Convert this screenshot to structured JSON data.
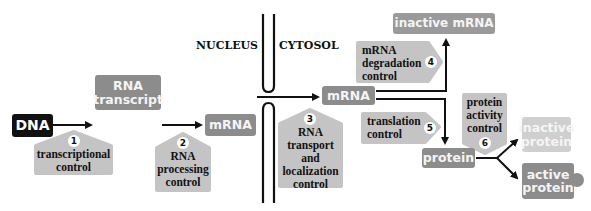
{
  "caption_fragment": "",
  "regions": {
    "nucleus": "NUCLEUS",
    "cytosol": "CYTOSOL"
  },
  "nodes": {
    "dna": "DNA",
    "rna_transcript_1": "RNA",
    "rna_transcript_2": "transcript",
    "mrna_nucleus": "mRNA",
    "mrna_cytosol": "mRNA",
    "inactive_mrna": "inactive mRNA",
    "protein": "protein",
    "inactive_protein_1": "inactive",
    "inactive_protein_2": "protein",
    "active_protein_1": "active",
    "active_protein_2": "protein"
  },
  "controls": [
    {
      "number": "1",
      "lines": [
        "transcriptional",
        "control"
      ]
    },
    {
      "number": "2",
      "lines": [
        "RNA",
        "processing",
        "control"
      ]
    },
    {
      "number": "3",
      "lines": [
        "RNA",
        "transport",
        "and",
        "localization",
        "control"
      ]
    },
    {
      "number": "4",
      "lines": [
        "mRNA",
        "degradation",
        "control"
      ]
    },
    {
      "number": "5",
      "lines": [
        "translation",
        "control"
      ]
    },
    {
      "number": "6",
      "lines": [
        "protein",
        "activity",
        "control"
      ]
    }
  ],
  "colors": {
    "dark_node": "#8c8c8c",
    "black_node": "#111111",
    "light_node": "#cfcfcf",
    "control_box": "#c4c4c4",
    "line": "#111111"
  }
}
